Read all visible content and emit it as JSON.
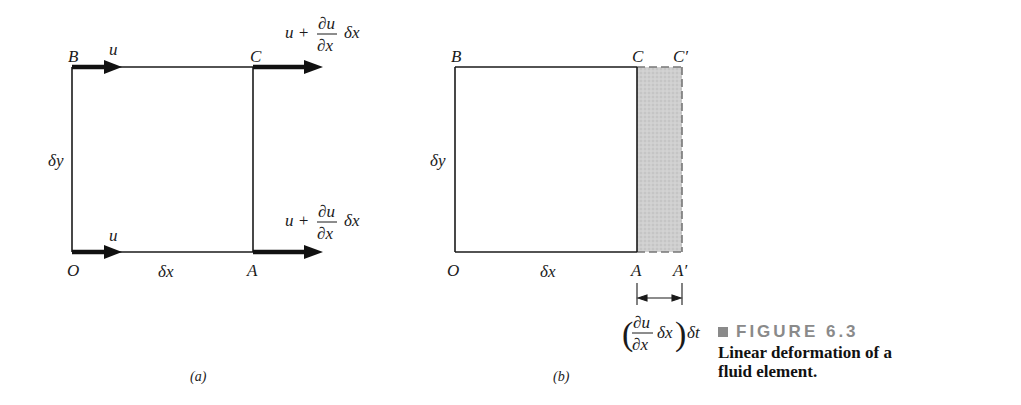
{
  "panel_a": {
    "corner_labels": {
      "B": "B",
      "C": "C",
      "O": "O",
      "A": "A"
    },
    "dimension_labels": {
      "dx": "δx",
      "dy": "δy"
    },
    "velocity_labels": {
      "B": "u",
      "O": "u",
      "C": {
        "prefix": "u +",
        "num": "∂u",
        "den": "∂x",
        "suffix": "δx"
      },
      "A": {
        "prefix": "u +",
        "num": "∂u",
        "den": "∂x",
        "suffix": "δx"
      }
    },
    "sublabel": "(a)"
  },
  "panel_b": {
    "corner_labels": {
      "B": "B",
      "C": "C",
      "C_prime": "C′",
      "O": "O",
      "A": "A",
      "A_prime": "A′"
    },
    "dimension_labels": {
      "dx": "δx",
      "dy": "δy"
    },
    "stretch_label": {
      "num": "∂u",
      "den": "∂x",
      "mid": "δx",
      "suffix": "δt"
    },
    "sublabel": "(b)",
    "shade_color": "#c8c8c8"
  },
  "caption": {
    "figure_label": "FIGURE 6.3",
    "text": "Linear deformation of a fluid element."
  }
}
